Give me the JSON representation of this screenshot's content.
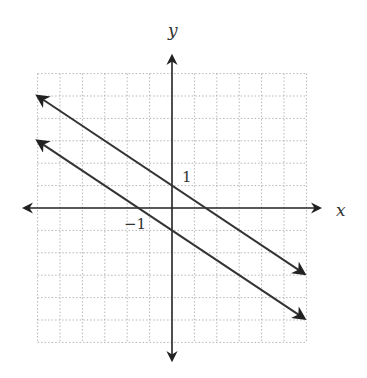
{
  "chart_data": {
    "type": "line",
    "title": "",
    "xlabel": "x",
    "ylabel": "y",
    "xlim": [
      -6,
      6
    ],
    "ylim": [
      -6,
      6
    ],
    "grid": true,
    "grid_style": "dotted",
    "tick_labels": [
      {
        "text": "1",
        "axis": "y",
        "value": 1
      },
      {
        "text": "−1",
        "axis": "x",
        "value": -1
      }
    ],
    "series": [
      {
        "name": "upper line",
        "equation": "y = -2/3 x + 1",
        "slope": -0.6667,
        "intercept": 1,
        "x": [
          -6,
          5.9
        ],
        "y": [
          5,
          -2.93
        ]
      },
      {
        "name": "lower line",
        "equation": "y = -2/3 x - 1",
        "slope": -0.6667,
        "intercept": -1,
        "x": [
          -6,
          5.9
        ],
        "y": [
          3,
          -4.93
        ]
      }
    ],
    "legend": null
  },
  "labels": {
    "x_axis": "x",
    "y_axis": "y",
    "tick_y1": "1",
    "tick_xm1": "−1"
  },
  "colors": {
    "line": "#333333",
    "grid": "#b0b0b0",
    "axis": "#222222"
  }
}
